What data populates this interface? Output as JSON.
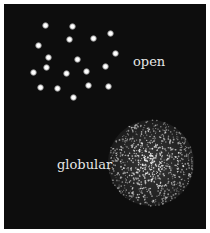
{
  "figure": {
    "background_color": "#0d0d0d",
    "star_color": "#ffffff",
    "label_color": "#e6e6e6"
  },
  "open_cluster": {
    "label": "open",
    "label_pos": {
      "x": 133,
      "y": 55
    },
    "stars": [
      {
        "x": 45,
        "y": 25
      },
      {
        "x": 72,
        "y": 26
      },
      {
        "x": 69,
        "y": 39
      },
      {
        "x": 93,
        "y": 38
      },
      {
        "x": 110,
        "y": 33
      },
      {
        "x": 38,
        "y": 45
      },
      {
        "x": 115,
        "y": 53
      },
      {
        "x": 48,
        "y": 57
      },
      {
        "x": 77,
        "y": 59
      },
      {
        "x": 105,
        "y": 66
      },
      {
        "x": 46,
        "y": 67
      },
      {
        "x": 33,
        "y": 72
      },
      {
        "x": 86,
        "y": 71
      },
      {
        "x": 66,
        "y": 73
      },
      {
        "x": 88,
        "y": 85
      },
      {
        "x": 108,
        "y": 86
      },
      {
        "x": 40,
        "y": 87
      },
      {
        "x": 57,
        "y": 88
      },
      {
        "x": 73,
        "y": 97
      }
    ],
    "star_size": 7
  },
  "globular_cluster": {
    "label": "globular",
    "label_pos": {
      "x": 57,
      "y": 158
    },
    "center": {
      "x": 151,
      "y": 163
    },
    "radius": 43,
    "dot_count": 900,
    "seed": 7
  }
}
